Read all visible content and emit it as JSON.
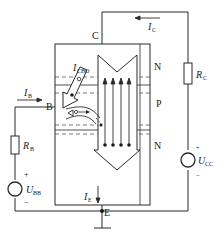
{
  "diagram": {
    "terminals": {
      "collector": "C",
      "base": "B",
      "emitter": "E"
    },
    "regions": {
      "top": "N",
      "middle": "P",
      "bottom": "N"
    },
    "currents": {
      "collector": {
        "symbol": "I",
        "sub": "C"
      },
      "base": {
        "symbol": "I",
        "sub": "B"
      },
      "emitter": {
        "symbol": "I",
        "sub": "E"
      },
      "leakage": {
        "symbol": "I",
        "sub": "CBO"
      }
    },
    "components": {
      "collector_resistor": {
        "symbol": "R",
        "sub": "C"
      },
      "base_resistor": {
        "symbol": "R",
        "sub": "B"
      },
      "collector_supply": {
        "symbol": "U",
        "sub": "CC",
        "plus": "+",
        "minus": "−"
      },
      "base_supply": {
        "symbol": "U",
        "sub": "BB",
        "plus": "+",
        "minus": "−"
      }
    },
    "colors": {
      "line": "#2a2a2a",
      "dash": "#555555",
      "background": "#ffffff"
    }
  }
}
